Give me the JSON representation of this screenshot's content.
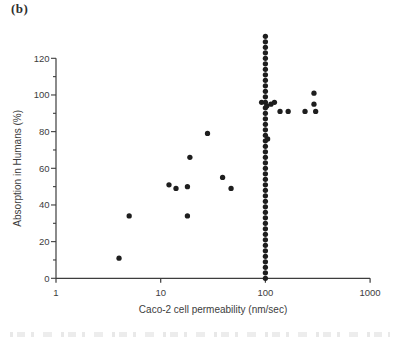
{
  "panel_label": "(b)",
  "colors": {
    "dot": "#1e1e1e",
    "axis": "#3d3d3d",
    "text": "#3d3d3d"
  },
  "chart_data": {
    "type": "scatter",
    "title": "",
    "xlabel": "Caco-2 cell permeability (nm/sec)",
    "ylabel": "Absorption in Humans (%)",
    "x_scale": "log",
    "xlim": [
      1,
      1000
    ],
    "x_ticks": [
      1,
      10,
      100,
      1000
    ],
    "ylim": [
      0,
      120
    ],
    "y_major_tick_step": 20,
    "y_minor_tick_step": 10,
    "grid": false,
    "legend": false,
    "scatter_points": [
      [
        4,
        11
      ],
      [
        5,
        34
      ],
      [
        12,
        51
      ],
      [
        14,
        49
      ],
      [
        18,
        50
      ],
      [
        18,
        34
      ],
      [
        19,
        66
      ],
      [
        28,
        79
      ],
      [
        39,
        55
      ],
      [
        47,
        49
      ],
      [
        92,
        96
      ],
      [
        103,
        94
      ],
      [
        113,
        95
      ],
      [
        122,
        96
      ],
      [
        105,
        76
      ],
      [
        138,
        91
      ],
      [
        165,
        91
      ],
      [
        239,
        91
      ],
      [
        291,
        101
      ],
      [
        291,
        95
      ],
      [
        302,
        91
      ]
    ],
    "column_at_x": 100,
    "column_y_values": [
      0,
      3,
      6,
      9,
      12,
      15,
      18,
      21,
      24,
      27,
      30,
      33,
      36,
      39,
      42,
      45,
      48,
      51,
      54,
      57,
      60,
      63,
      66,
      69,
      72,
      75,
      78,
      81,
      84,
      87,
      90,
      93,
      96,
      99,
      102,
      105,
      108,
      111,
      114,
      117,
      120,
      123,
      126,
      129,
      132
    ]
  }
}
